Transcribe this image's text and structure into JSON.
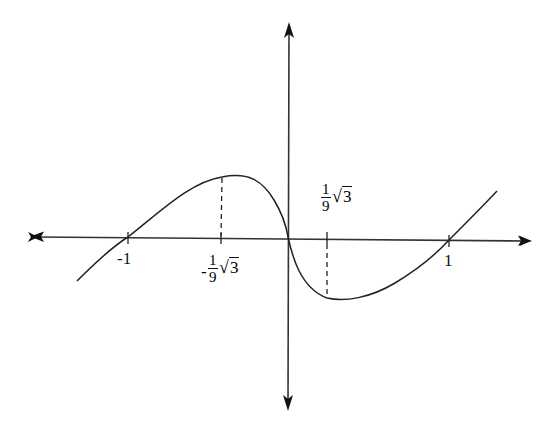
{
  "diagram": {
    "type": "function-graph",
    "axes": {
      "x_axis": {
        "arrows": "both"
      },
      "y_axis": {
        "arrows": "both"
      }
    },
    "tick_labels": {
      "neg_one": "-1",
      "pos_one": "1",
      "local_max": {
        "sign": "-",
        "numerator": "1",
        "denominator": "9",
        "radicand": "3",
        "radical": "√"
      },
      "local_min": {
        "sign": "",
        "numerator": "1",
        "denominator": "9",
        "radicand": "3",
        "radical": "√"
      }
    },
    "critical_points": [
      {
        "kind": "local maximum",
        "x_label": "-1/9√3"
      },
      {
        "kind": "local minimum",
        "x_label": "1/9√3"
      }
    ],
    "zeros": [
      "-1",
      "0",
      "1"
    ],
    "colors": {
      "stroke": "#222222",
      "background": "#ffffff"
    }
  }
}
